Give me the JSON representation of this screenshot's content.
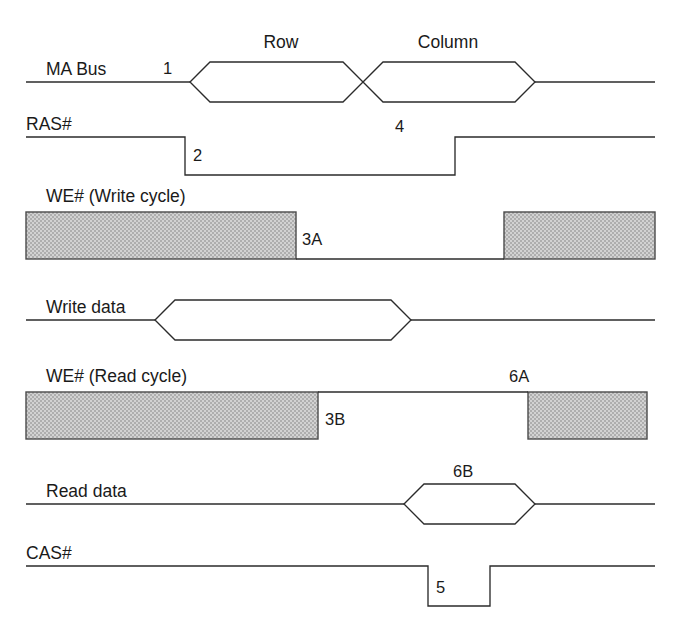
{
  "diagram": {
    "background_color": "#ffffff",
    "line_color": "#2b2b2b",
    "gray_fill_color": "#c2c2c2",
    "gray_stroke_color": "#4a4a4a",
    "text_color": "#1a1a1a",
    "width": 679,
    "height": 641
  },
  "signals": [
    {
      "id": "ma-bus",
      "label": "MA Bus",
      "label_x": 46,
      "label_y": 75,
      "baseline_y": 82,
      "type": "bus",
      "line_start_x": 26,
      "line_end_x": 655,
      "hex_half_height": 20,
      "segments": [
        {
          "value": "Row",
          "x_start": 190,
          "x_cross_left": 363,
          "label_x": 281,
          "label_y": 48
        },
        {
          "value": "Column",
          "x_start": 363,
          "x_end": 535,
          "label_x": 448,
          "label_y": 48
        }
      ],
      "annotations": [
        {
          "text": "1",
          "x": 166,
          "y": 74
        },
        {
          "text": "4",
          "x": 400,
          "y": 131
        }
      ]
    },
    {
      "id": "ras",
      "label": "RAS#",
      "label_x": 26,
      "label_y": 130,
      "high_y": 137,
      "low_y": 175,
      "type": "digital",
      "line_start_x": 26,
      "line_end_x": 655,
      "fall_x": 185,
      "rise_x": 455,
      "annotations": [
        {
          "text": "2",
          "x": 196,
          "y": 160
        }
      ]
    },
    {
      "id": "we-write",
      "label": "WE# (Write cycle)",
      "label_x": 46,
      "label_y": 202,
      "type": "gray-blocks",
      "rect_top_y": 212,
      "rect_bottom_y": 259,
      "baseline_y": 259,
      "line_start_x": 26,
      "line_end_x": 655,
      "blocks": [
        {
          "x_start": 26,
          "x_end": 296
        },
        {
          "x_start": 504,
          "x_end": 655
        }
      ],
      "annotations": [
        {
          "text": "3A",
          "x": 304,
          "y": 245
        }
      ]
    },
    {
      "id": "write-data",
      "label": "Write data",
      "label_x": 46,
      "label_y": 313,
      "baseline_y": 320,
      "type": "bus",
      "line_start_x": 26,
      "line_end_x": 655,
      "hex_half_height": 20,
      "segments": [
        {
          "value": "",
          "x_start": 155,
          "x_end": 411,
          "label_x": 283,
          "label_y": 313
        }
      ],
      "annotations": []
    },
    {
      "id": "we-read",
      "label": "WE# (Read cycle)",
      "label_x": 46,
      "label_y": 382,
      "type": "gray-blocks",
      "rect_top_y": 392,
      "rect_bottom_y": 439,
      "baseline_y": 392,
      "line_start_x": 26,
      "line_end_x": 655,
      "blocks": [
        {
          "x_start": 26,
          "x_end": 318
        },
        {
          "x_start": 528,
          "x_end": 647
        }
      ],
      "annotations": [
        {
          "text": "3B",
          "x": 327,
          "y": 425
        },
        {
          "text": "6A",
          "x": 512,
          "y": 382
        }
      ]
    },
    {
      "id": "read-data",
      "label": "Read data",
      "label_x": 46,
      "label_y": 497,
      "baseline_y": 504,
      "type": "bus",
      "line_start_x": 26,
      "line_end_x": 655,
      "hex_half_height": 20,
      "segments": [
        {
          "value": "",
          "x_start": 404,
          "x_end": 535,
          "label_x": 470,
          "label_y": 497
        }
      ],
      "annotations": [
        {
          "text": "6B",
          "x": 459,
          "y": 477
        }
      ]
    },
    {
      "id": "cas",
      "label": "CAS#",
      "label_x": 26,
      "label_y": 559,
      "high_y": 566,
      "low_y": 606,
      "type": "digital",
      "line_start_x": 26,
      "line_end_x": 655,
      "fall_x": 428,
      "rise_x": 490,
      "annotations": [
        {
          "text": "5",
          "x": 438,
          "y": 592
        }
      ]
    }
  ],
  "labels": {
    "ma_bus": "MA Bus",
    "ras": "RAS#",
    "we_write": "WE# (Write cycle)",
    "write_data": "Write data",
    "we_read": "WE# (Read cycle)",
    "read_data": "Read data",
    "cas": "CAS#",
    "row": "Row",
    "column": "Column",
    "n1": "1",
    "n2": "2",
    "n3a": "3A",
    "n3b": "3B",
    "n4": "4",
    "n5": "5",
    "n6a": "6A",
    "n6b": "6B"
  }
}
